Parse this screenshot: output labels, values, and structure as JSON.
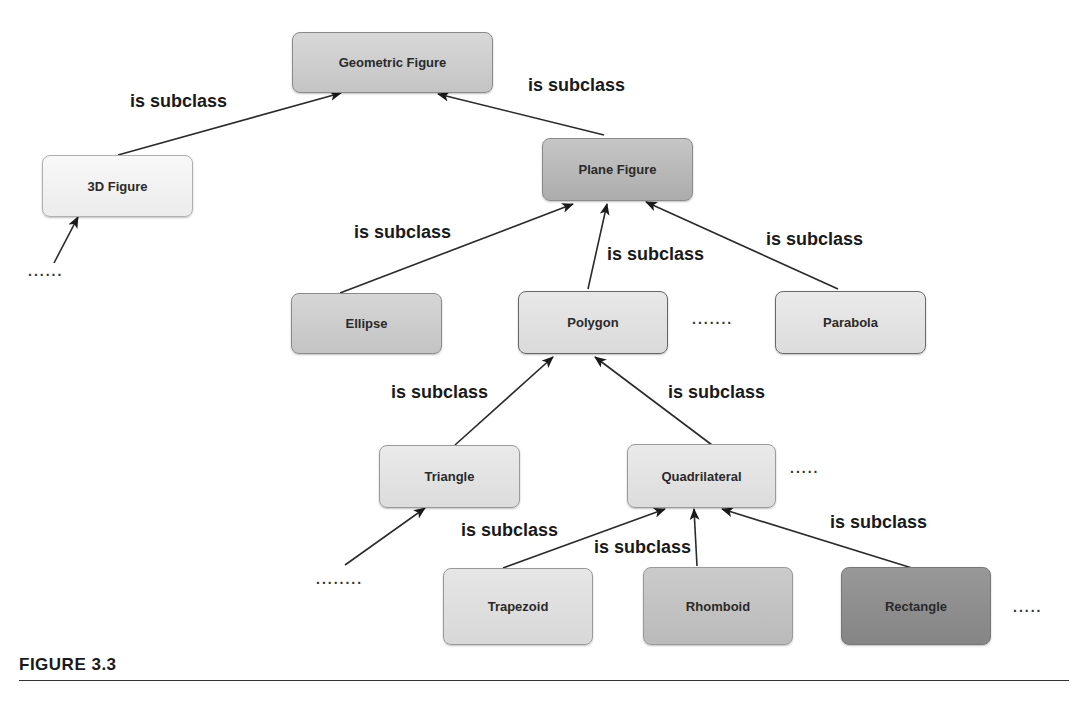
{
  "nodes": {
    "geometric_figure": {
      "label": "Geometric Figure",
      "color": "#cfcfcf"
    },
    "figure_3d": {
      "label": "3D Figure",
      "color": "#f3f3f3"
    },
    "plane_figure": {
      "label": "Plane Figure",
      "color": "#b9b9b9"
    },
    "ellipse": {
      "label": "Ellipse",
      "color": "#cdcdcd"
    },
    "polygon": {
      "label": "Polygon",
      "color": "#e2e2e2"
    },
    "parabola": {
      "label": "Parabola",
      "color": "#e4e4e4"
    },
    "triangle": {
      "label": "Triangle",
      "color": "#e4e4e4"
    },
    "quadrilateral": {
      "label": "Quadrilateral",
      "color": "#e4e4e4"
    },
    "trapezoid": {
      "label": "Trapezoid",
      "color": "#e0e0e0"
    },
    "rhomboid": {
      "label": "Rhomboid",
      "color": "#c3c3c3"
    },
    "rectangle": {
      "label": "Rectangle",
      "color": "#8f8f8f"
    }
  },
  "edge_labels": {
    "figure3d_to_geometric": "is subclass",
    "plane_to_geometric": "is subclass",
    "ellipse_to_plane": "is subclass",
    "polygon_to_plane": "is subclass",
    "parabola_to_plane": "is subclass",
    "triangle_to_polygon": "is subclass",
    "quadrilateral_to_polygon": "is subclass",
    "trapezoid_to_quadrilateral": "is subclass",
    "rhomboid_to_quadrilateral": "is subclass",
    "rectangle_to_quadrilateral": "is subclass"
  },
  "ellipses": {
    "below_3d": "......",
    "between_polygon_parabola": ".......",
    "right_of_quadrilateral": ".....",
    "below_triangle": "........",
    "right_of_rectangle": "....."
  },
  "caption": {
    "label": "FIGURE 3.3"
  },
  "edges": [
    {
      "from": "figure_3d",
      "to": "geometric_figure",
      "relation": "is subclass"
    },
    {
      "from": "plane_figure",
      "to": "geometric_figure",
      "relation": "is subclass"
    },
    {
      "from": "ellipse",
      "to": "plane_figure",
      "relation": "is subclass"
    },
    {
      "from": "polygon",
      "to": "plane_figure",
      "relation": "is subclass"
    },
    {
      "from": "parabola",
      "to": "plane_figure",
      "relation": "is subclass"
    },
    {
      "from": "triangle",
      "to": "polygon",
      "relation": "is subclass"
    },
    {
      "from": "quadrilateral",
      "to": "polygon",
      "relation": "is subclass"
    },
    {
      "from": "trapezoid",
      "to": "quadrilateral",
      "relation": "is subclass"
    },
    {
      "from": "rhomboid",
      "to": "quadrilateral",
      "relation": "is subclass"
    },
    {
      "from": "rectangle",
      "to": "quadrilateral",
      "relation": "is subclass"
    }
  ]
}
